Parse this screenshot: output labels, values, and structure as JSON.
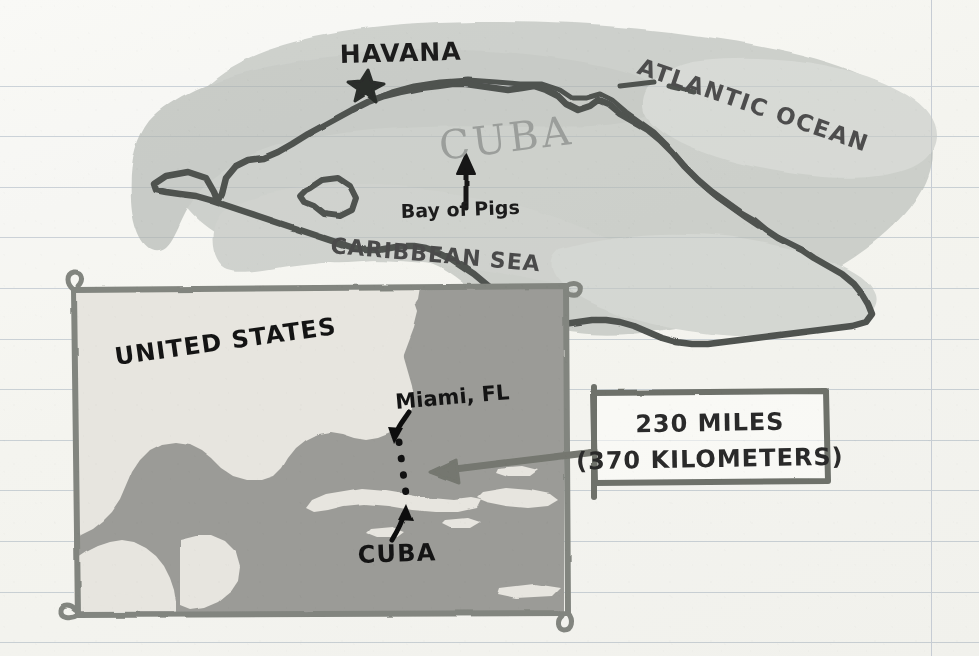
{
  "page": {
    "title": "Cuba and United States proximity map",
    "paper": {
      "background_color": "#f8f8f5",
      "rule_line_color": "#cfd6dd",
      "margin_line_color": "#c6ccd4",
      "rule_spacing_px": 50,
      "margin_line_x": 931
    }
  },
  "main_map": {
    "name": "hand-drawn map of Cuba",
    "outline_color": "#4f5250",
    "water_wash_color": "#b9bdb9",
    "labels": {
      "country": "CUBA",
      "capital": "HAVANA",
      "ocean": "ATLANTIC OCEAN",
      "sea": "CARIBBEAN SEA",
      "bay": "Bay of Pigs"
    },
    "markers": {
      "capital_marker": "star"
    }
  },
  "inset_map": {
    "name": "regional inset map",
    "frame_color": "#7e817d",
    "land_color": "#e6e4de",
    "water_color": "#9b9b97",
    "labels": {
      "united_states": "UNITED STATES",
      "miami": "Miami, FL",
      "cuba": "CUBA"
    },
    "distance_path": "dotted line from Miami to Cuba"
  },
  "callout": {
    "name": "distance callout box",
    "border_color": "#6e716d",
    "line_1": "230 MILES",
    "line_2": "(370 KILOMETERS)",
    "arrow": "points left into inset map"
  }
}
